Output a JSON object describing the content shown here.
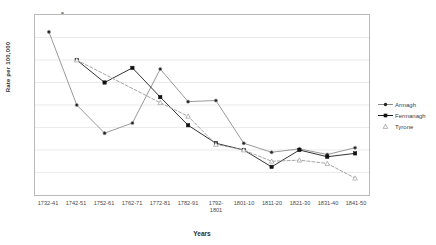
{
  "chart_data": {
    "type": "line",
    "title": "",
    "xlabel": "Years",
    "ylabel": "Rate per 100,000",
    "categories": [
      "1732-41",
      "1742-51",
      "1752-61",
      "1762-71",
      "1772-81",
      "1782-91",
      "1792-1801",
      "1801-10",
      "1811-20",
      "1821-30",
      "1831-40",
      "1841-50"
    ],
    "xtick_labels": [
      "1732-41",
      "1742-51",
      "1752-61",
      "1762-71",
      "1772-81",
      "1782-91",
      "1792-\n1801",
      "1801-10",
      "1811-20",
      "1821-30",
      "1831-40",
      "1841-50"
    ],
    "ylim": [
      0,
      8
    ],
    "yticks": [
      1,
      2,
      3,
      4,
      5,
      6,
      7,
      8
    ],
    "grid": true,
    "legend_position": "right",
    "series": [
      {
        "name": "Armagh",
        "color": "#8c8c8c",
        "marker": "circle",
        "linestyle": "solid",
        "values": [
          7.25,
          4.0,
          2.75,
          3.2,
          5.6,
          4.15,
          4.2,
          2.3,
          1.9,
          2.05,
          1.8,
          2.1
        ]
      },
      {
        "name": "Fermanagh",
        "color": "#1a1a1a",
        "marker": "square",
        "linestyle": "solid",
        "values": [
          null,
          6.0,
          5.0,
          5.65,
          4.35,
          3.1,
          2.3,
          2.0,
          1.25,
          2.0,
          1.7,
          1.85
        ]
      },
      {
        "name": "Tyrone",
        "color": "#9a9a9a",
        "marker": "triangle",
        "linestyle": "dashed",
        "values": [
          null,
          6.0,
          null,
          null,
          4.1,
          3.5,
          2.25,
          2.0,
          1.5,
          1.55,
          1.4,
          0.75
        ]
      }
    ]
  },
  "legend": {
    "items": [
      {
        "label": "Armagh"
      },
      {
        "label": "Fermanagh"
      },
      {
        "label": "Tyrone"
      }
    ]
  },
  "axes": {
    "y_title": "Rate per 100,000",
    "x_title": "Years"
  }
}
